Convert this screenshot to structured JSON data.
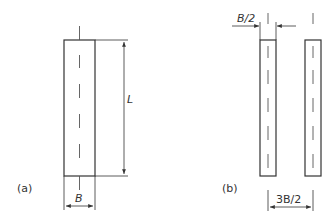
{
  "figure_a": {
    "label": "(a)",
    "length_label": "L",
    "width_label": "B"
  },
  "figure_b": {
    "label": "(b)",
    "gap_label": "B/2",
    "spacing_label": "3B/2"
  },
  "colors": {
    "stroke": "#333333",
    "background": "#ffffff"
  }
}
